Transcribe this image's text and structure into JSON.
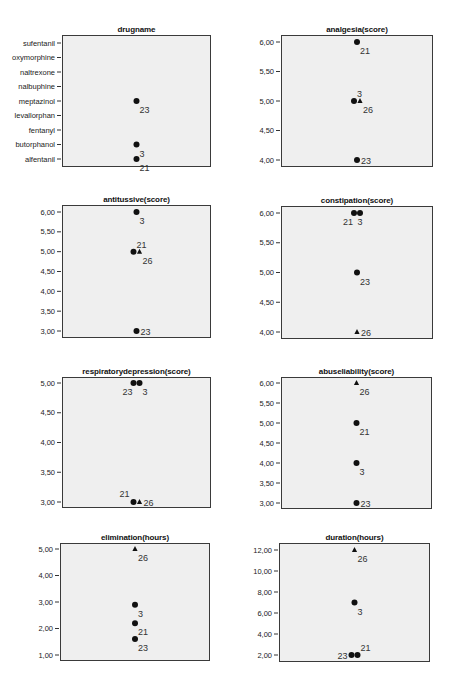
{
  "chart_data": [
    {
      "type": "scatter",
      "title": "drugname",
      "axis": "categorical",
      "categories": [
        "alfentanil",
        "butorphanol",
        "fentanyl",
        "levallorphan",
        "meptazinol",
        "nalbuphine",
        "naltrexone",
        "oxymorphine",
        "sufentanil"
      ],
      "points": [
        {
          "case": "23",
          "value": "meptazinol",
          "marker": "circle",
          "label_pos": "br"
        },
        {
          "case": "3",
          "value": "butorphanol",
          "marker": "circle",
          "label_pos": "br"
        },
        {
          "case": "21",
          "value": "alfentanil",
          "marker": "circle",
          "label_pos": "br"
        }
      ],
      "grid": false
    },
    {
      "type": "scatter",
      "title": "analgesia(score)",
      "ylim": [
        4,
        6
      ],
      "ticks": [
        "6,00",
        "5,50",
        "5,00",
        "4,50",
        "4,00"
      ],
      "tick_values": [
        6,
        5.5,
        5,
        4.5,
        4
      ],
      "points": [
        {
          "case": "21",
          "value": 6,
          "marker": "circle",
          "label_pos": "br"
        },
        {
          "case": "3",
          "value": 5,
          "marker": "circle",
          "dx": -3,
          "label_pos": "tr"
        },
        {
          "case": "26",
          "value": 5,
          "marker": "triangle",
          "dx": 3,
          "label_pos": "br"
        },
        {
          "case": "23",
          "value": 4,
          "marker": "circle",
          "label_pos": "r"
        }
      ],
      "grid": false
    },
    {
      "type": "scatter",
      "title": "antitussive(score)",
      "ylim": [
        3,
        6
      ],
      "ticks": [
        "6,00",
        "5,50",
        "5,00",
        "4,50",
        "4,00",
        "3,50",
        "3,00"
      ],
      "tick_values": [
        6,
        5.5,
        5,
        4.5,
        4,
        3.5,
        3
      ],
      "points": [
        {
          "case": "3",
          "value": 6,
          "marker": "circle",
          "label_pos": "br"
        },
        {
          "case": "21",
          "value": 5,
          "marker": "circle",
          "dx": -3,
          "label_pos": "tr"
        },
        {
          "case": "26",
          "value": 5,
          "marker": "triangle",
          "dx": 3,
          "label_pos": "br"
        },
        {
          "case": "23",
          "value": 3,
          "marker": "circle",
          "label_pos": "r"
        }
      ],
      "grid": false
    },
    {
      "type": "scatter",
      "title": "constipation(score)",
      "ylim": [
        4,
        6
      ],
      "ticks": [
        "6,00",
        "5,50",
        "5,00",
        "4,50",
        "4,00"
      ],
      "tick_values": [
        6,
        5.5,
        5,
        4.5,
        4
      ],
      "points": [
        {
          "case": "21",
          "value": 6,
          "marker": "circle",
          "dx": -3,
          "label_pos": "bl"
        },
        {
          "case": "3",
          "value": 6,
          "marker": "circle",
          "dx": 3,
          "label_pos": "b"
        },
        {
          "case": "23",
          "value": 5,
          "marker": "circle",
          "label_pos": "br"
        },
        {
          "case": "26",
          "value": 4,
          "marker": "triangle",
          "label_pos": "r"
        }
      ],
      "grid": false
    },
    {
      "type": "scatter",
      "title": "respiratorydepression(score)",
      "ylim": [
        3,
        5
      ],
      "ticks": [
        "5,00",
        "4,50",
        "4,00",
        "3,50",
        "3,00"
      ],
      "tick_values": [
        5,
        4.5,
        4,
        3.5,
        3
      ],
      "points": [
        {
          "case": "23",
          "value": 5,
          "marker": "circle",
          "dx": -3,
          "label_pos": "bl"
        },
        {
          "case": "3",
          "value": 5,
          "marker": "circle",
          "dx": 3,
          "label_pos": "br"
        },
        {
          "case": "21",
          "value": 3,
          "marker": "circle",
          "dx": -3,
          "label_pos": "tl"
        },
        {
          "case": "26",
          "value": 3,
          "marker": "triangle",
          "dx": 3,
          "label_pos": "r"
        }
      ],
      "grid": false
    },
    {
      "type": "scatter",
      "title": "abuseliability(score)",
      "ylim": [
        3,
        6
      ],
      "ticks": [
        "6,00",
        "5,50",
        "5,00",
        "4,50",
        "4,00",
        "3,50",
        "3,00"
      ],
      "tick_values": [
        6,
        5.5,
        5,
        4.5,
        4,
        3.5,
        3
      ],
      "points": [
        {
          "case": "26",
          "value": 6,
          "marker": "triangle",
          "label_pos": "br"
        },
        {
          "case": "21",
          "value": 5,
          "marker": "circle",
          "label_pos": "br"
        },
        {
          "case": "3",
          "value": 4,
          "marker": "circle",
          "label_pos": "br"
        },
        {
          "case": "23",
          "value": 3,
          "marker": "circle",
          "label_pos": "r"
        }
      ],
      "grid": false
    },
    {
      "type": "scatter",
      "title": "elimination(hours)",
      "ylim": [
        1,
        5
      ],
      "ticks": [
        "5,00",
        "4,00",
        "3,00",
        "2,00",
        "1,00"
      ],
      "tick_values": [
        5,
        4,
        3,
        2,
        1
      ],
      "points": [
        {
          "case": "26",
          "value": 5,
          "marker": "triangle",
          "label_pos": "br"
        },
        {
          "case": "3",
          "value": 2.9,
          "marker": "circle",
          "label_pos": "br"
        },
        {
          "case": "21",
          "value": 2.2,
          "marker": "circle",
          "label_pos": "br"
        },
        {
          "case": "23",
          "value": 1.6,
          "marker": "circle",
          "label_pos": "br"
        }
      ],
      "grid": false
    },
    {
      "type": "scatter",
      "title": "duration(hours)",
      "ylim": [
        2,
        12
      ],
      "ticks": [
        "12,00",
        "10,00",
        "8,00",
        "6,00",
        "4,00",
        "2,00"
      ],
      "tick_values": [
        12,
        10,
        8,
        6,
        4,
        2
      ],
      "points": [
        {
          "case": "26",
          "value": 12,
          "marker": "triangle",
          "label_pos": "br"
        },
        {
          "case": "3",
          "value": 7,
          "marker": "circle",
          "label_pos": "br"
        },
        {
          "case": "23",
          "value": 2,
          "marker": "circle",
          "dx": -3,
          "label_pos": "l"
        },
        {
          "case": "21",
          "value": 2,
          "marker": "circle",
          "dx": 3,
          "label_pos": "tr"
        }
      ],
      "grid": false
    }
  ],
  "colors": {
    "plot_background": "#efefef",
    "frame": "#3a3a3a",
    "marker": "#111111"
  }
}
